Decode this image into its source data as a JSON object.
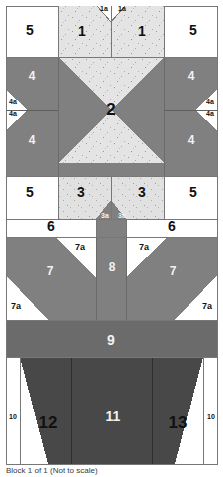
{
  "figure": {
    "caption": "Block 1 of 1 (Not to scale)"
  },
  "palette": {
    "background": "#ffffff",
    "light_speckle": "#e3e3e3",
    "medium_gray": "#808080",
    "band_gray": "#6b6b6b",
    "dark_gray": "#484848",
    "outline": "#777777",
    "label_dark": "#111111",
    "label_light": "#f2f2f2"
  },
  "rows": [
    {
      "name": "row-1",
      "pieces": [
        {
          "id": "piece-5-left",
          "label": "5",
          "x": 30,
          "y": 30,
          "size": "lg",
          "tone": "dark"
        },
        {
          "id": "piece-1-left",
          "label": "1",
          "x": 82,
          "y": 31,
          "size": "lg",
          "tone": "dark"
        },
        {
          "id": "piece-1a-left",
          "label": "1a",
          "x": 104,
          "y": 8,
          "size": "xs",
          "tone": "dark"
        },
        {
          "id": "piece-1a-right",
          "label": "1a",
          "x": 122,
          "y": 8,
          "size": "xs",
          "tone": "dark"
        },
        {
          "id": "piece-1-right",
          "label": "1",
          "x": 142,
          "y": 31,
          "size": "lg",
          "tone": "dark"
        },
        {
          "id": "piece-5-right",
          "label": "5",
          "x": 193,
          "y": 30,
          "size": "lg",
          "tone": "dark"
        }
      ]
    },
    {
      "name": "row-2",
      "pieces": [
        {
          "id": "piece-4-upper-left",
          "label": "4",
          "x": 32,
          "y": 76,
          "size": "md",
          "tone": "light"
        },
        {
          "id": "piece-4-upper-right",
          "label": "4",
          "x": 191,
          "y": 76,
          "size": "md",
          "tone": "light"
        },
        {
          "id": "piece-4a-left-top",
          "label": "4a",
          "x": 13,
          "y": 101,
          "size": "xs",
          "tone": "dark"
        },
        {
          "id": "piece-4a-left-bot",
          "label": "4a",
          "x": 13,
          "y": 113,
          "size": "xs",
          "tone": "dark"
        },
        {
          "id": "piece-4a-right-top",
          "label": "4a",
          "x": 210,
          "y": 101,
          "size": "xs",
          "tone": "dark"
        },
        {
          "id": "piece-4a-right-bot",
          "label": "4a",
          "x": 210,
          "y": 113,
          "size": "xs",
          "tone": "dark"
        },
        {
          "id": "piece-2",
          "label": "2",
          "x": 111,
          "y": 110,
          "size": "xl",
          "tone": "dark"
        },
        {
          "id": "piece-4-lower-left",
          "label": "4",
          "x": 32,
          "y": 140,
          "size": "md",
          "tone": "light"
        },
        {
          "id": "piece-4-lower-right",
          "label": "4",
          "x": 191,
          "y": 140,
          "size": "md",
          "tone": "light"
        }
      ]
    },
    {
      "name": "row-3",
      "pieces": [
        {
          "id": "piece-5-left-bottom",
          "label": "5",
          "x": 30,
          "y": 192,
          "size": "lg",
          "tone": "dark"
        },
        {
          "id": "piece-3-left",
          "label": "3",
          "x": 81,
          "y": 192,
          "size": "lg",
          "tone": "dark"
        },
        {
          "id": "piece-3a-left",
          "label": "3a",
          "x": 105,
          "y": 215,
          "size": "xs",
          "tone": "light"
        },
        {
          "id": "piece-3a-right",
          "label": "3a",
          "x": 122,
          "y": 215,
          "size": "xs",
          "tone": "light"
        },
        {
          "id": "piece-3-right",
          "label": "3",
          "x": 142,
          "y": 192,
          "size": "lg",
          "tone": "dark"
        },
        {
          "id": "piece-5-right-bottom",
          "label": "5",
          "x": 193,
          "y": 192,
          "size": "lg",
          "tone": "dark"
        }
      ]
    },
    {
      "name": "row-4",
      "pieces": [
        {
          "id": "piece-6-left",
          "label": "6",
          "x": 51,
          "y": 226,
          "size": "lg",
          "tone": "dark"
        },
        {
          "id": "piece-6-right",
          "label": "6",
          "x": 172,
          "y": 226,
          "size": "lg",
          "tone": "dark"
        }
      ]
    },
    {
      "name": "row-5",
      "pieces": [
        {
          "id": "piece-7a-top-left",
          "label": "7a",
          "x": 80,
          "y": 247,
          "size": "sm",
          "tone": "dark"
        },
        {
          "id": "piece-7a-top-right",
          "label": "7a",
          "x": 144,
          "y": 247,
          "size": "sm",
          "tone": "dark"
        },
        {
          "id": "piece-7-left",
          "label": "7",
          "x": 50,
          "y": 271,
          "size": "md",
          "tone": "light"
        },
        {
          "id": "piece-8",
          "label": "8",
          "x": 112,
          "y": 267,
          "size": "md",
          "tone": "light"
        },
        {
          "id": "piece-7-right",
          "label": "7",
          "x": 173,
          "y": 271,
          "size": "md",
          "tone": "light"
        },
        {
          "id": "piece-7a-bottom-left",
          "label": "7a",
          "x": 15,
          "y": 306,
          "size": "sm",
          "tone": "dark"
        },
        {
          "id": "piece-7a-bottom-right",
          "label": "7a",
          "x": 208,
          "y": 306,
          "size": "sm",
          "tone": "dark"
        }
      ]
    },
    {
      "name": "row-6",
      "pieces": [
        {
          "id": "piece-9",
          "label": "9",
          "x": 111,
          "y": 340,
          "size": "lg",
          "tone": "light"
        }
      ]
    },
    {
      "name": "row-7",
      "pieces": [
        {
          "id": "piece-10-left",
          "label": "10",
          "x": 9,
          "y": 416,
          "size": "xs",
          "tone": "dark"
        },
        {
          "id": "piece-12",
          "label": "12",
          "x": 48,
          "y": 423,
          "size": "xl",
          "tone": "dark"
        },
        {
          "id": "piece-11",
          "label": "11",
          "x": 113,
          "y": 416,
          "size": "lg",
          "tone": "light"
        },
        {
          "id": "piece-13",
          "label": "13",
          "x": 178,
          "y": 423,
          "size": "xl",
          "tone": "dark"
        },
        {
          "id": "piece-10-right",
          "label": "10",
          "x": 214,
          "y": 416,
          "size": "xs",
          "tone": "dark"
        }
      ]
    }
  ]
}
